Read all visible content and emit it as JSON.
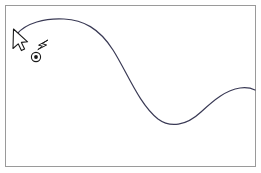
{
  "canvas": {
    "width": 261,
    "height": 173,
    "background_color": "#ffffff",
    "title": "Bezier curve drawing canvas"
  },
  "frame": {
    "name": "drawing-frame",
    "x": 5,
    "y": 5,
    "width": 250,
    "height": 161,
    "stroke_color": "#9a9a9a",
    "stroke_width": 1,
    "fill_color": "#ffffff"
  },
  "curve": {
    "name": "bezier-curve",
    "stroke_color": "#3a3a55",
    "stroke_width": 1.2,
    "fill": "none",
    "description": "Smooth S-shaped curve drawn with the pen tool",
    "path": "M 17 34 C 26 23, 45 18, 64 19 C 83 20, 99 28, 113 50 C 127 72, 139 104, 158 119 C 170 128, 186 126, 201 112 C 214 100, 226 90, 240 88 C 247 87, 251 88, 255 90",
    "points": [
      {
        "label": "start",
        "x": 17,
        "y": 34
      },
      {
        "label": "crest",
        "x": 64,
        "y": 19
      },
      {
        "label": "inflection",
        "x": 131,
        "y": 80
      },
      {
        "label": "trough",
        "x": 170,
        "y": 123
      },
      {
        "label": "second-crest",
        "x": 238,
        "y": 88
      },
      {
        "label": "end",
        "x": 255,
        "y": 90
      }
    ]
  },
  "pen_cursor": {
    "name": "arrow-pointer-cursor",
    "x": 13,
    "y": 29,
    "fill_color": "#ffffff",
    "stroke_color": "#1a1a1a",
    "stroke_width": 1.1,
    "path": "M 13.5 29 L 13.0 48.5 L 18.2 43.8 L 21.4 50.6 L 24.6 49.0 L 21.4 42.4 L 27.6 41.8 Z",
    "tooltip": "Pen tool pointer"
  },
  "lightning_glyph": {
    "name": "lightning-bolt-icon",
    "x": 38,
    "y": 40,
    "fill_color": "#ffffff",
    "stroke_color": "#1a1a1a",
    "stroke_width": 1.0,
    "path": "M 47.6 40.2 L 38.6 45.2 L 42.4 46.2 L 37.8 49.6 L 46.6 45.0 L 42.6 43.8 Z",
    "tooltip": "Pen tool drag indicator"
  },
  "anchor_point": {
    "name": "curve-anchor-point",
    "cx": 36,
    "cy": 57,
    "outer_radius": 4.6,
    "inner_radius": 1.9,
    "outer_stroke_color": "#1a1a1a",
    "outer_fill_color": "#ffffff",
    "inner_fill_color": "#1a1a1a",
    "outer_stroke_width": 1.1,
    "tooltip": "Selected anchor point"
  },
  "control_handle": {
    "name": "anchor-control-handle",
    "x1": 36,
    "y1": 57,
    "x2": 45,
    "y2": 43,
    "stroke_color": "#1a1a1a",
    "stroke_width": 0.9,
    "visible": false
  },
  "accessibility": {
    "canvas_label": "Vector drawing canvas with a smooth S-curve, pen tool cursor and a selected anchor point"
  }
}
